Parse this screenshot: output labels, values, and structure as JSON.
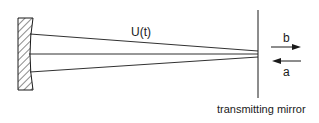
{
  "diagram": {
    "beam_label": "U(t)",
    "output_label": "b",
    "input_label": "a",
    "mirror_label": "transmitting mirror",
    "colors": {
      "stroke": "#1a1a1a",
      "background": "#ffffff"
    }
  }
}
